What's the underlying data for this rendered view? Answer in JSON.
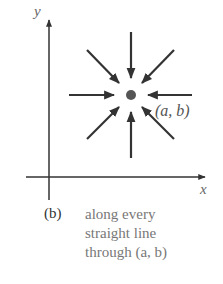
{
  "diagram": {
    "axes": {
      "x_label": "x",
      "y_label": "y"
    },
    "point_label": "(a, b)",
    "arrow_count": 8
  },
  "caption": {
    "part": "(b)",
    "lines": [
      "along every",
      "straight line",
      "through (a, b)"
    ]
  }
}
